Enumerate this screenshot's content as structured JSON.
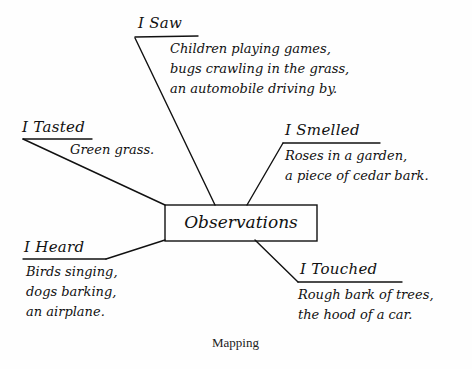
{
  "diagram": {
    "type": "mind-map",
    "center": {
      "label": "Observations"
    },
    "branches": [
      {
        "id": "saw",
        "label": "I Saw",
        "lines": [
          "Children playing games,",
          "bugs crawling in the grass,",
          "an automobile driving by."
        ]
      },
      {
        "id": "tasted",
        "label": "I Tasted",
        "lines": [
          "Green grass."
        ]
      },
      {
        "id": "smelled",
        "label": "I Smelled",
        "lines": [
          "Roses in a garden,",
          "a piece of cedar bark."
        ]
      },
      {
        "id": "heard",
        "label": "I Heard",
        "lines": [
          "Birds singing,",
          "dogs barking,",
          "an airplane."
        ]
      },
      {
        "id": "touched",
        "label": "I Touched",
        "lines": [
          "Rough bark of trees,",
          "the hood of a car."
        ]
      }
    ],
    "caption": "Mapping",
    "colors": {
      "ink": "#111111",
      "background": "#fefefe"
    }
  }
}
